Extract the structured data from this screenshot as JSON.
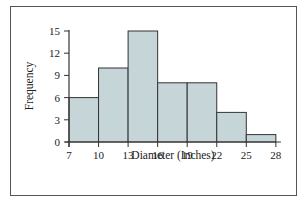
{
  "chart_data": {
    "type": "bar",
    "subtype": "histogram",
    "title": "",
    "xlabel": "Diameter (Inches)",
    "ylabel": "Frequency",
    "bin_edges": [
      7,
      10,
      13,
      16,
      19,
      22,
      25,
      28
    ],
    "categories": [
      "7-10",
      "10-13",
      "13-16",
      "16-19",
      "19-22",
      "22-25",
      "25-28"
    ],
    "values": [
      6,
      10,
      15,
      8,
      8,
      4,
      1
    ],
    "x_ticks": [
      7,
      10,
      13,
      16,
      19,
      22,
      25,
      28
    ],
    "y_ticks": [
      0,
      3,
      6,
      9,
      12,
      15
    ],
    "xlim": [
      7,
      28
    ],
    "ylim": [
      0,
      15
    ],
    "grid": false,
    "legend": null
  },
  "colors": {
    "bar_fill": "#c6d5d7",
    "bar_edge": "#333333",
    "axis": "#333333",
    "frame": "#555555"
  }
}
